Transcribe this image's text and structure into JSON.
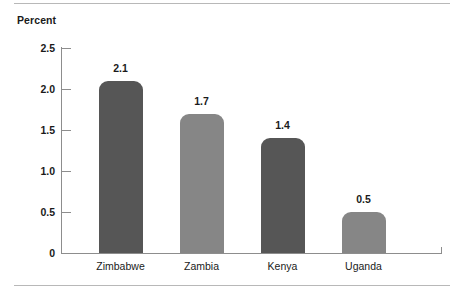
{
  "chart_data": {
    "type": "bar",
    "title": "",
    "ylabel": "Percent",
    "xlabel": "",
    "categories": [
      "Zimbabwe",
      "Zambia",
      "Kenya",
      "Uganda"
    ],
    "values": [
      2.1,
      1.7,
      1.4,
      0.5
    ],
    "value_labels": [
      "2.1",
      "1.7",
      "1.4",
      "0.5"
    ],
    "bar_colors": [
      "#565656",
      "#868686",
      "#565656",
      "#868686"
    ],
    "ylim": [
      0,
      2.5
    ],
    "yticks": [
      0,
      0.5,
      1.0,
      1.5,
      2.0,
      2.5
    ],
    "ytick_labels": [
      "0",
      "0.5",
      "1.0",
      "1.5",
      "2.0",
      "2.5"
    ],
    "grid": false,
    "legend": null,
    "axis_color": "#8d8d8d",
    "rule_color": "#b8b8b8"
  }
}
